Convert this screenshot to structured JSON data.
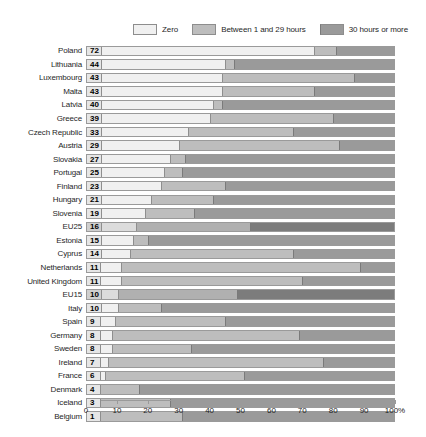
{
  "chart_data": {
    "type": "bar",
    "subtype": "stacked-horizontal-100pct",
    "title": "",
    "xlabel": "",
    "ylabel": "",
    "xlim": [
      0,
      100
    ],
    "xunit": "%",
    "grid": false,
    "legend_position": "top-right",
    "ticks": [
      "0",
      "10",
      "20",
      "30",
      "40",
      "50",
      "60",
      "70",
      "80",
      "90",
      "100%"
    ],
    "tick_values": [
      0,
      10,
      20,
      30,
      40,
      50,
      60,
      70,
      80,
      90,
      100
    ],
    "legend": [
      {
        "label": "Zero",
        "color": "#f0f0f0"
      },
      {
        "label": "Between 1 and 29 hours",
        "color": "#bdbdbd"
      },
      {
        "label": "30 hours or more",
        "color": "#9a9a9a"
      }
    ],
    "series": [
      {
        "name": "Zero",
        "key": "zero"
      },
      {
        "name": "Between 1 and 29 hours",
        "key": "mid"
      },
      {
        "name": "30 hours or more",
        "key": "high"
      }
    ],
    "categories": [
      "Poland",
      "Lithuania",
      "Luxembourg",
      "Malta",
      "Latvia",
      "Greece",
      "Czech Republic",
      "Austria",
      "Slovakia",
      "Portugal",
      "Finland",
      "Hungary",
      "Slovenia",
      "EU25",
      "Estonia",
      "Cyprus",
      "Netherlands",
      "United Kingdom",
      "EU15",
      "Italy",
      "Spain",
      "Germany",
      "Sweden",
      "Ireland",
      "France",
      "Denmark",
      "Iceland",
      "Belgium"
    ],
    "rows": [
      {
        "label": "Poland",
        "value": "72",
        "zero": 74,
        "mid": 7,
        "high": 19,
        "highlight": false
      },
      {
        "label": "Lithuania",
        "value": "44",
        "zero": 45,
        "mid": 3,
        "high": 52,
        "highlight": false
      },
      {
        "label": "Luxembourg",
        "value": "43",
        "zero": 44,
        "mid": 43,
        "high": 13,
        "highlight": false
      },
      {
        "label": "Malta",
        "value": "43",
        "zero": 44,
        "mid": 30,
        "high": 26,
        "highlight": false
      },
      {
        "label": "Latvia",
        "value": "40",
        "zero": 41,
        "mid": 3,
        "high": 56,
        "highlight": false
      },
      {
        "label": "Greece",
        "value": "39",
        "zero": 40,
        "mid": 40,
        "high": 20,
        "highlight": false
      },
      {
        "label": "Czech Republic",
        "value": "33",
        "zero": 33,
        "mid": 34,
        "high": 33,
        "highlight": false
      },
      {
        "label": "Austria",
        "value": "29",
        "zero": 30,
        "mid": 52,
        "high": 18,
        "highlight": false
      },
      {
        "label": "Slovakia",
        "value": "27",
        "zero": 27,
        "mid": 5,
        "high": 68,
        "highlight": false
      },
      {
        "label": "Portugal",
        "value": "25",
        "zero": 25,
        "mid": 6,
        "high": 69,
        "highlight": false
      },
      {
        "label": "Finland",
        "value": "23",
        "zero": 24,
        "mid": 21,
        "high": 55,
        "highlight": false
      },
      {
        "label": "Hungary",
        "value": "21",
        "zero": 21,
        "mid": 20,
        "high": 59,
        "highlight": false
      },
      {
        "label": "Slovenia",
        "value": "19",
        "zero": 19,
        "mid": 16,
        "high": 65,
        "highlight": false
      },
      {
        "label": "EU25",
        "value": "16",
        "zero": 16,
        "mid": 37,
        "high": 47,
        "highlight": true
      },
      {
        "label": "Estonia",
        "value": "15",
        "zero": 15,
        "mid": 5,
        "high": 80,
        "highlight": false
      },
      {
        "label": "Cyprus",
        "value": "14",
        "zero": 14,
        "mid": 53,
        "high": 33,
        "highlight": false
      },
      {
        "label": "Netherlands",
        "value": "11",
        "zero": 11,
        "mid": 78,
        "high": 11,
        "highlight": false
      },
      {
        "label": "United Kingdom",
        "value": "11",
        "zero": 11,
        "mid": 59,
        "high": 30,
        "highlight": false
      },
      {
        "label": "EU15",
        "value": "10",
        "zero": 10,
        "mid": 39,
        "high": 51,
        "highlight": true
      },
      {
        "label": "Italy",
        "value": "10",
        "zero": 10,
        "mid": 14,
        "high": 76,
        "highlight": false
      },
      {
        "label": "Spain",
        "value": "9",
        "zero": 9,
        "mid": 36,
        "high": 55,
        "highlight": false
      },
      {
        "label": "Germany",
        "value": "8",
        "zero": 8,
        "mid": 61,
        "high": 31,
        "highlight": false
      },
      {
        "label": "Sweden",
        "value": "8",
        "zero": 8,
        "mid": 26,
        "high": 66,
        "highlight": false
      },
      {
        "label": "Ireland",
        "value": "7",
        "zero": 7,
        "mid": 70,
        "high": 23,
        "highlight": false
      },
      {
        "label": "France",
        "value": "6",
        "zero": 6,
        "mid": 45,
        "high": 49,
        "highlight": false
      },
      {
        "label": "Denmark",
        "value": "4",
        "zero": 4,
        "mid": 13,
        "high": 83,
        "highlight": false
      },
      {
        "label": "Iceland",
        "value": "3",
        "zero": 3,
        "mid": 24,
        "high": 73,
        "highlight": false
      },
      {
        "label": "Belgium",
        "value": "1",
        "zero": 1,
        "mid": 30,
        "high": 69,
        "highlight": false
      }
    ]
  }
}
